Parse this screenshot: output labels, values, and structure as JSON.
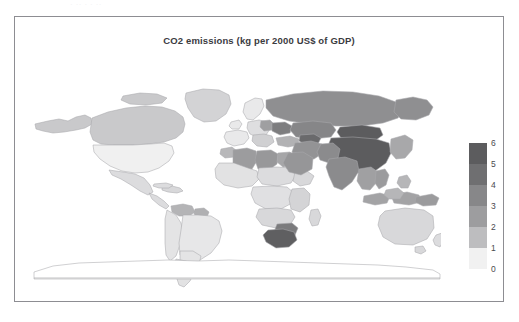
{
  "page": {
    "background_color": "#ffffff",
    "frame_border_color": "#8d8d92",
    "clipped_top_text": "·  ··   ·      ·    ··"
  },
  "chart_data": {
    "type": "heatmap",
    "subtype": "choropleth-world-map",
    "title": "CO2 emissions (kg per 2000 US$ of GDP)",
    "xlabel": "",
    "ylabel": "",
    "legend": {
      "position": "right",
      "orientation": "vertical",
      "tick_labels": [
        "6",
        "5",
        "4",
        "3",
        "2",
        "1",
        "0"
      ],
      "range": [
        0,
        6
      ],
      "bands": [
        {
          "label": "5 - 6",
          "color": "#5c5c5e"
        },
        {
          "label": "4 - 5",
          "color": "#6f6f71"
        },
        {
          "label": "3 - 4",
          "color": "#878789"
        },
        {
          "label": "2 - 3",
          "color": "#9d9d9f"
        },
        {
          "label": "1 - 2",
          "color": "#bdbdbf"
        },
        {
          "label": "0 - 1",
          "color": "#f1f1f1"
        }
      ]
    },
    "colors": {
      "ocean": "#ffffff",
      "country_outline": "#a9a9ad",
      "no_data": "#ffffff"
    },
    "regions": [
      {
        "name": "China",
        "value": 6.0,
        "color": "#5c5c5e"
      },
      {
        "name": "Mongolia",
        "value": 6.0,
        "color": "#5c5c5e"
      },
      {
        "name": "South Africa",
        "value": 5.6,
        "color": "#5f5f61"
      },
      {
        "name": "Uzbekistan",
        "value": 5.2,
        "color": "#6a6a6c"
      },
      {
        "name": "India",
        "value": 3.4,
        "color": "#8b8b8d"
      },
      {
        "name": "Russia",
        "value": 3.2,
        "color": "#8f8f91"
      },
      {
        "name": "Kazakhstan",
        "value": 3.6,
        "color": "#868688"
      },
      {
        "name": "Ukraine",
        "value": 4.0,
        "color": "#7d7d7f"
      },
      {
        "name": "Poland",
        "value": 2.4,
        "color": "#9f9fa1"
      },
      {
        "name": "Iran",
        "value": 3.0,
        "color": "#939395"
      },
      {
        "name": "Saudi Arabia",
        "value": 2.9,
        "color": "#969698"
      },
      {
        "name": "Libya",
        "value": 2.8,
        "color": "#98989a"
      },
      {
        "name": "Algeria",
        "value": 2.6,
        "color": "#9c9c9e"
      },
      {
        "name": "Egypt",
        "value": 2.2,
        "color": "#a6a6a8"
      },
      {
        "name": "Zimbabwe",
        "value": 4.2,
        "color": "#7b7b7d"
      },
      {
        "name": "Indonesia",
        "value": 2.3,
        "color": "#a3a3a5"
      },
      {
        "name": "Thailand",
        "value": 2.4,
        "color": "#a0a0a2"
      },
      {
        "name": "Vietnam",
        "value": 2.6,
        "color": "#9b9b9d"
      },
      {
        "name": "Canada",
        "value": 1.4,
        "color": "#c9c9cb"
      },
      {
        "name": "Alaska",
        "value": 1.4,
        "color": "#c9c9cb"
      },
      {
        "name": "Greenland",
        "value": 1.2,
        "color": "#d3d3d5"
      },
      {
        "name": "United States",
        "value": 0.7,
        "color": "#f0f0f0"
      },
      {
        "name": "Mexico",
        "value": 1.0,
        "color": "#dcdcde"
      },
      {
        "name": "Venezuela",
        "value": 1.9,
        "color": "#b4b4b6"
      },
      {
        "name": "Guyana",
        "value": 2.0,
        "color": "#b0b0b2"
      },
      {
        "name": "Brazil",
        "value": 0.8,
        "color": "#e7e7e8"
      },
      {
        "name": "Argentina",
        "value": 0.9,
        "color": "#e2e2e3"
      },
      {
        "name": "Australia",
        "value": 1.1,
        "color": "#d8d8da"
      },
      {
        "name": "Western Europe",
        "value": 0.8,
        "color": "#e9e9ea"
      },
      {
        "name": "Antarctica",
        "value": null,
        "color": "#ffffff"
      }
    ]
  }
}
